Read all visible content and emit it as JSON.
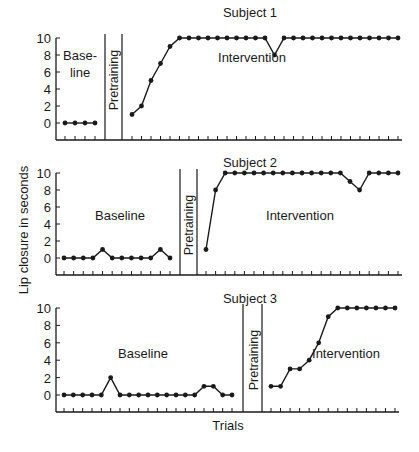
{
  "chart_data": [
    {
      "type": "line",
      "title": "Subject 1",
      "xlabel": "",
      "ylabel": "Lip closure in seconds",
      "ylim": [
        0,
        10
      ],
      "yticks": [
        0,
        2,
        4,
        6,
        8,
        10
      ],
      "grid": false,
      "phases": [
        {
          "name": "Baseline",
          "label": "Base-\nline",
          "values": [
            0,
            0,
            0,
            0
          ]
        },
        {
          "name": "Pretraining",
          "label": "Pretraining",
          "values": []
        },
        {
          "name": "Intervention",
          "label": "Intervention",
          "values": [
            1,
            2,
            5,
            7,
            9,
            10,
            10,
            10,
            10,
            10,
            10,
            10,
            10,
            10,
            10,
            8,
            10,
            10,
            10,
            10,
            10,
            10,
            10,
            10,
            10,
            10,
            10,
            10,
            10
          ]
        }
      ]
    },
    {
      "type": "line",
      "title": "Subject 2",
      "xlabel": "",
      "ylabel": "Lip closure in seconds",
      "ylim": [
        0,
        10
      ],
      "yticks": [
        0,
        2,
        4,
        6,
        8,
        10
      ],
      "grid": false,
      "phases": [
        {
          "name": "Baseline",
          "label": "Baseline",
          "values": [
            0,
            0,
            0,
            0,
            1,
            0,
            0,
            0,
            0,
            0,
            1,
            0
          ]
        },
        {
          "name": "Pretraining",
          "label": "Pretraining",
          "values": []
        },
        {
          "name": "Intervention",
          "label": "Intervention",
          "values": [
            1,
            8,
            10,
            10,
            10,
            10,
            10,
            10,
            10,
            10,
            10,
            10,
            10,
            10,
            10,
            9,
            8,
            10,
            10,
            10,
            10
          ]
        }
      ]
    },
    {
      "type": "line",
      "title": "Subject 3",
      "xlabel": "Trials",
      "ylabel": "Lip closure in seconds",
      "ylim": [
        0,
        10
      ],
      "yticks": [
        0,
        2,
        4,
        6,
        8,
        10
      ],
      "grid": false,
      "phases": [
        {
          "name": "Baseline",
          "label": "Baseline",
          "values": [
            0,
            0,
            0,
            0,
            0,
            2,
            0,
            0,
            0,
            0,
            0,
            0,
            0,
            0,
            0,
            1,
            1,
            0,
            0
          ]
        },
        {
          "name": "Pretraining",
          "label": "Pretraining",
          "values": []
        },
        {
          "name": "Intervention",
          "label": "Intervention",
          "values": [
            1,
            1,
            3,
            3,
            4,
            6,
            9,
            10,
            10,
            10,
            10,
            10,
            10,
            10
          ]
        }
      ]
    }
  ],
  "labels": {
    "ylabel": "Lip closure in seconds",
    "xlabel": "Trials"
  },
  "colors": {
    "ink": "#1a1a1a",
    "background": "#ffffff"
  }
}
